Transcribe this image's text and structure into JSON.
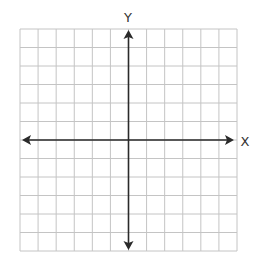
{
  "grid": {
    "columns": 12,
    "rows": 12,
    "left": 20,
    "top": 29,
    "right": 237,
    "bottom": 251,
    "y_axis_column_index": 6,
    "x_axis_row_index": 6,
    "line_color": "#c4c4c4",
    "axis_color": "#2a2a2a"
  },
  "axes": {
    "x_label": "X",
    "y_label": "Y",
    "x_arrows": "both",
    "y_arrows": "both"
  }
}
